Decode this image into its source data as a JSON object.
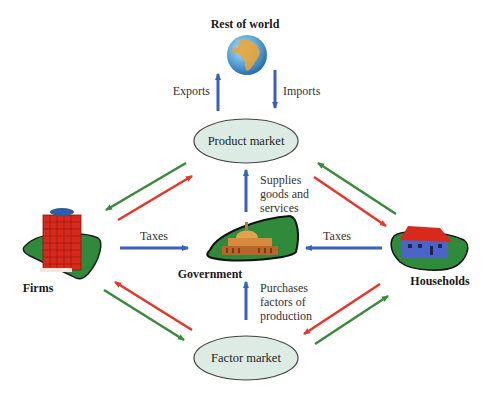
{
  "diagram": {
    "title_node": "Rest of world",
    "nodes": {
      "rest_of_world": "Rest of world",
      "product_market": "Product market",
      "factor_market": "Factor market",
      "firms": "Firms",
      "government": "Government",
      "households": "Households"
    },
    "flows": {
      "exports": "Exports",
      "imports": "Imports",
      "taxes_firms": "Taxes",
      "taxes_households": "Taxes",
      "supplies": [
        "Supplies",
        "goods and",
        "services"
      ],
      "purchases": [
        "Purchases",
        "factors of",
        "production"
      ]
    },
    "colors": {
      "blue_arrow": "#3b5fc0",
      "red_arrow": "#e8352a",
      "green_arrow": "#3a8a3a",
      "ellipse_fill": "#dcece4",
      "ellipse_stroke": "#444444"
    }
  }
}
